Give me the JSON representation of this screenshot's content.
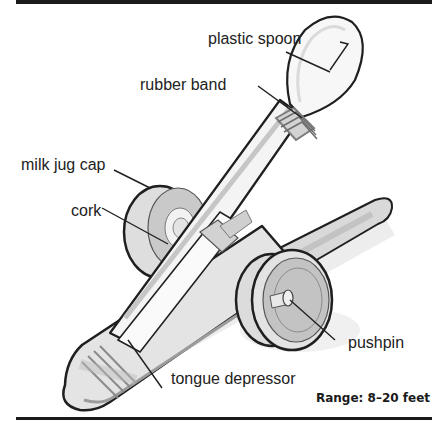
{
  "diagram": {
    "labels": {
      "plastic_spoon": "plastic spoon",
      "rubber_band": "rubber band",
      "milk_jug_cap": "milk jug cap",
      "cork": "cork",
      "pushpin": "pushpin",
      "tongue_depressor": "tongue depressor"
    },
    "range_note": "Range: 8–20 feet"
  },
  "colors": {
    "rule": "#1a1a1a",
    "outline": "#1f1f1f",
    "fill_light": "#ececec",
    "fill_mid": "#cfcfcf",
    "fill_dark": "#a9a9a9",
    "shadow": "#e2e2e2"
  }
}
